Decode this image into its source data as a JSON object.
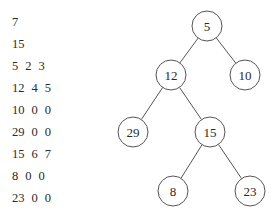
{
  "input_lines": [
    [
      "7"
    ],
    [
      "15"
    ],
    [
      "5",
      "2",
      "3"
    ],
    [
      "12",
      "4",
      "5"
    ],
    [
      "10",
      "0",
      "0"
    ],
    [
      "29",
      "0",
      "0"
    ],
    [
      "15",
      "6",
      "7"
    ],
    [
      "8",
      "0",
      "0"
    ],
    [
      "23",
      "0",
      "0"
    ]
  ],
  "tree": {
    "nodes": [
      {
        "id": 1,
        "label": "5",
        "cx": 207,
        "cy": 26
      },
      {
        "id": 2,
        "label": "12",
        "cx": 171,
        "cy": 75
      },
      {
        "id": 3,
        "label": "10",
        "cx": 245,
        "cy": 75
      },
      {
        "id": 4,
        "label": "29",
        "cx": 133,
        "cy": 132
      },
      {
        "id": 5,
        "label": "15",
        "cx": 210,
        "cy": 132
      },
      {
        "id": 6,
        "label": "8",
        "cx": 173,
        "cy": 191
      },
      {
        "id": 7,
        "label": "23",
        "cx": 250,
        "cy": 191
      }
    ],
    "edges": [
      [
        1,
        2
      ],
      [
        1,
        3
      ],
      [
        2,
        4
      ],
      [
        2,
        5
      ],
      [
        5,
        6
      ],
      [
        5,
        7
      ]
    ],
    "radius": 15,
    "stroke_color": "#555555"
  }
}
